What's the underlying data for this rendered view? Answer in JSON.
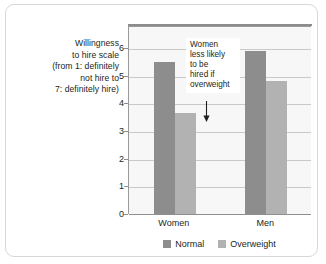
{
  "chart_data": {
    "type": "bar",
    "title": "",
    "xlabel": "",
    "ylabel": "Willingness to hire scale (from 1: definitely not hire to 7: definitely hire)",
    "ylabel_lines": [
      "Willingness",
      "to hire scale",
      "(from 1: definitely",
      "not hire to",
      "7: definitely hire)"
    ],
    "categories": [
      "Women",
      "Men"
    ],
    "series": [
      {
        "name": "Normal",
        "color": "#8d8d8d",
        "values": [
          5.5,
          5.9
        ]
      },
      {
        "name": "Overweight",
        "color": "#b2b2b2",
        "values": [
          3.65,
          4.8
        ]
      }
    ],
    "ylim": [
      0,
      6.8
    ],
    "yticks": [
      0,
      1,
      2,
      3,
      4,
      5,
      6
    ],
    "ytick_labels": [
      "0",
      "1",
      "2",
      "3",
      "4",
      "5",
      "6"
    ],
    "grid": true,
    "legend_position": "bottom",
    "annotations": [
      {
        "text": "Women less likely to be hired if overweight",
        "lines": [
          "Women",
          "less likely",
          "to be",
          "hired if",
          "overweight"
        ],
        "points_to_category": "Women",
        "points_to_series": "Overweight",
        "points_to_value": 3.65,
        "arrow": "down-arrow-icon"
      }
    ]
  },
  "legend": {
    "items": [
      {
        "label": "Normal",
        "color": "#8d8d8d"
      },
      {
        "label": "Overweight",
        "color": "#b2b2b2"
      }
    ]
  },
  "colors": {
    "card_background": "#ffffff",
    "card_border": "#d8d8d8",
    "plot_background": "#f7f7f7",
    "axis": "#8f8f8f",
    "gridline": "#c9c9c9",
    "text": "#231f20"
  }
}
